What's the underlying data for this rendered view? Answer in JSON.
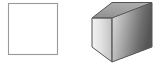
{
  "canvas": {
    "width": 158,
    "height": 67,
    "background": "#ffffff",
    "caption": ""
  },
  "figure": {
    "name": "square-and-cube-comparison",
    "shape_count": 2
  },
  "shapes": [
    {
      "id": "square",
      "label": "square",
      "type": "2d-square-outline",
      "fill": "#ffffff",
      "stroke": "#9a9a9a",
      "stroke_width": 1,
      "x": 8,
      "y": 3,
      "width": 49,
      "height": 51
    },
    {
      "id": "cube",
      "label": "cube",
      "type": "3d-cube-shaded",
      "stroke": "#555555",
      "stroke_width": 1,
      "bounds": {
        "x": 92,
        "y": 2,
        "width": 60,
        "height": 60
      },
      "faces": {
        "top": {
          "name": "top-face",
          "points": "112,18 132,2 152,2 132,18",
          "fill_start": "#a8a8a8",
          "fill_end": "#8e8e8e"
        },
        "left": {
          "name": "left-face",
          "points": "92,18 112,18 112,62 92,52",
          "fill_start": "#eeeeee",
          "fill_end": "#c4c4c4"
        },
        "right": {
          "name": "right-face",
          "points": "112,18 152,18 152,62 112,62",
          "fill_start": "#dcdcdc",
          "fill_end": "#555555"
        }
      }
    }
  ],
  "colors": {
    "outline_gray": "#9a9a9a",
    "edge_dark": "#555555",
    "top_face_gray": "#9a9a9a",
    "left_face_light": "#e4e4e4",
    "right_face_dark": "#585858",
    "background_white": "#ffffff"
  }
}
